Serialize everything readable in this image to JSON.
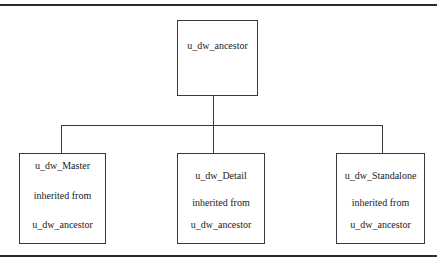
{
  "diagram": {
    "type": "inheritance-hierarchy",
    "root": {
      "label": "u_dw_ancestor"
    },
    "children": [
      {
        "name": "u_dw_Master",
        "relation": "inherited from",
        "parent": "u_dw_ancestor"
      },
      {
        "name": "u_dw_Detail",
        "relation": "inherited from",
        "parent": "u_dw_ancestor"
      },
      {
        "name": "u_dw_Standalone",
        "relation": "inherited from",
        "parent": "u_dw_ancestor"
      }
    ],
    "colors": {
      "line": "#3a3a3a",
      "rule": "#2a2a2a",
      "background": "#ffffff"
    }
  }
}
